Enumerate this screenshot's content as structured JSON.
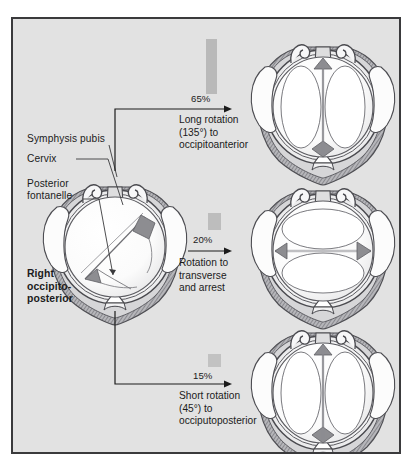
{
  "figure": {
    "background_color": "#e2e2e2",
    "border_color": "#3a3a3c"
  },
  "anatomy_labels": [
    {
      "id": "symphysis-pubis",
      "text": "Symphysis pubis"
    },
    {
      "id": "cervix",
      "text": "Cervix"
    },
    {
      "id": "posterior-fontanelle",
      "text": "Posterior\nfontanelle"
    }
  ],
  "start_position": {
    "label": "Right\noccipito-\nposterior"
  },
  "branches": [
    {
      "id": "long-rotation",
      "percent": "65%",
      "percent_value": 65,
      "description": "Long rotation\n(135°) to\noccipitoanterior",
      "outcome": "occipitoanterior"
    },
    {
      "id": "transverse-arrest",
      "percent": "20%",
      "percent_value": 20,
      "description": "Rotation to\ntransverse\nand arrest",
      "outcome": "transverse"
    },
    {
      "id": "short-rotation",
      "percent": "15%",
      "percent_value": 15,
      "description": "Short rotation\n(45°) to\nocciputoposterior",
      "outcome": "occipitoposterior"
    }
  ],
  "colors": {
    "bar": "#b9b9b9",
    "suture_fill": "#8d8d91",
    "skull": "#fdfdfd",
    "outline": "#55555a",
    "muscle": "#9a9a9e",
    "text": "#1b1b1b"
  }
}
